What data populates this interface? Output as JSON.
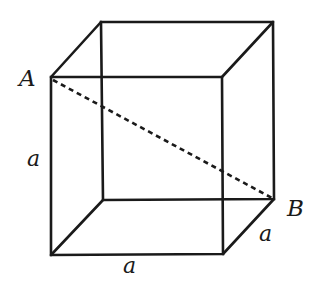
{
  "diagram": {
    "type": "cube",
    "stroke_color": "#1a1a1a",
    "vertices": {
      "front_top_left": [
        51,
        77
      ],
      "front_top_right": [
        222,
        77
      ],
      "front_bottom_left": [
        51,
        255
      ],
      "front_bottom_right": [
        223,
        254
      ],
      "back_top_left": [
        101,
        22
      ],
      "back_top_right": [
        273,
        22
      ],
      "back_bottom_left": [
        103,
        200
      ],
      "back_bottom_right": [
        274,
        199
      ]
    },
    "diagonal": {
      "from": "A",
      "to": "B",
      "style": "dashed"
    },
    "labels": {
      "point_a": "A",
      "point_b": "B",
      "edge_vertical": "a",
      "edge_bottom": "a",
      "edge_depth": "a"
    }
  }
}
